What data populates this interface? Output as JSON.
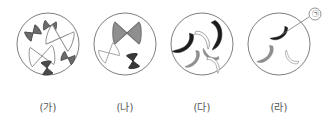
{
  "figure": {
    "background_color": "#ffffff",
    "width": 329,
    "height": 124,
    "cells": [
      {
        "id": "cell-ga",
        "label": "(가)",
        "center_x": 48,
        "center_y": 44,
        "radius": 31,
        "chromosome_count": 6,
        "chromosome_shape": "X-shaped",
        "chromosomes": [
          {
            "name": "dark-small-x-upper-left",
            "fill": "#6b6b6b",
            "stroke": "#4a4a4a",
            "cx": 33,
            "cy": 33,
            "len": 13,
            "rot": -35,
            "shade": "dark"
          },
          {
            "name": "dark-small-x-top",
            "fill": "#6b6b6b",
            "stroke": "#4a4a4a",
            "cx": 49,
            "cy": 26,
            "len": 11,
            "rot": 10,
            "shade": "dark"
          },
          {
            "name": "light-large-x-upper-right",
            "fill": "#ffffff",
            "stroke": "#8d8d8d",
            "cx": 59,
            "cy": 38,
            "len": 22,
            "rot": 20,
            "shade": "light"
          },
          {
            "name": "light-large-x-lower-left",
            "fill": "#ffffff",
            "stroke": "#8d8d8d",
            "cx": 42,
            "cy": 56,
            "len": 22,
            "rot": -8,
            "shade": "light"
          },
          {
            "name": "dark-small-x-right",
            "fill": "#6b6b6b",
            "stroke": "#4a4a4a",
            "cx": 68,
            "cy": 58,
            "len": 11,
            "rot": 25,
            "shade": "dark"
          },
          {
            "name": "dark-small-x-bottom",
            "fill": "#4a4a4a",
            "stroke": "#3a3a3a",
            "cx": 47,
            "cy": 68,
            "len": 12,
            "rot": 80,
            "shade": "dark"
          }
        ]
      },
      {
        "id": "cell-na",
        "label": "(나)",
        "center_x": 125,
        "center_y": 44,
        "radius": 31,
        "chromosome_count": 3,
        "chromosome_shape": "X-shaped",
        "chromosomes": [
          {
            "name": "gray-large-x-top",
            "fill": "#8f8f8f",
            "stroke": "#6f6f6f",
            "cx": 127,
            "cy": 33,
            "len": 24,
            "rot": 0,
            "shade": "gray"
          },
          {
            "name": "light-x-left",
            "fill": "#ffffff",
            "stroke": "#9a9a9a",
            "cx": 109,
            "cy": 53,
            "len": 16,
            "rot": -30,
            "shade": "light"
          },
          {
            "name": "dark-small-x-lower-right",
            "fill": "#3a3a3a",
            "stroke": "#2a2a2a",
            "cx": 133,
            "cy": 61,
            "len": 13,
            "rot": 80,
            "shade": "dark"
          }
        ]
      },
      {
        "id": "cell-da",
        "label": "(다)",
        "center_x": 202,
        "center_y": 44,
        "radius": 31,
        "chromosome_count": 6,
        "chromosome_shape": "rod-curved",
        "chromosomes": [
          {
            "name": "black-rod-left",
            "fill": "#1c1c1c",
            "cx": 183,
            "cy": 44,
            "shade": "black"
          },
          {
            "name": "black-rod-top-right",
            "fill": "#1c1c1c",
            "cx": 214,
            "cy": 33,
            "shade": "black"
          },
          {
            "name": "light-rod-middle",
            "fill": "#ffffff",
            "cx": 203,
            "cy": 40,
            "shade": "light"
          },
          {
            "name": "gray-rod-lower-left",
            "fill": "#8f8f8f",
            "cx": 192,
            "cy": 59,
            "shade": "gray"
          },
          {
            "name": "gray-rod-center-low",
            "fill": "#8f8f8f",
            "cx": 211,
            "cy": 54,
            "shade": "gray"
          },
          {
            "name": "light-rod-lower-right",
            "fill": "#ffffff",
            "cx": 214,
            "cy": 65,
            "shade": "light"
          }
        ]
      },
      {
        "id": "cell-ra",
        "label": "(라)",
        "center_x": 279,
        "center_y": 44,
        "radius": 31,
        "chromosome_count": 3,
        "chromosome_shape": "rod-curved",
        "chromosomes": [
          {
            "name": "black-rod-callout-target",
            "fill": "#1c1c1c",
            "cx": 279,
            "cy": 33,
            "shade": "black"
          },
          {
            "name": "gray-rod-left",
            "fill": "#8f8f8f",
            "cx": 265,
            "cy": 54,
            "shade": "gray"
          },
          {
            "name": "light-rod-right",
            "fill": "#ffffff",
            "cx": 292,
            "cy": 57,
            "shade": "light"
          }
        ]
      }
    ],
    "callout": {
      "symbol": "㉠",
      "marker_cx": 315,
      "marker_cy": 14,
      "marker_r": 6,
      "leader_from_x": 309,
      "leader_from_y": 17,
      "leader_to_x": 281,
      "leader_to_y": 35,
      "points_to": "cell-ra"
    },
    "colors": {
      "cell_outline": "#6f6f6f",
      "dark_chromosome": "#1c1c1c",
      "gray_chromosome": "#8f8f8f",
      "light_chromosome": "#ffffff",
      "light_chromosome_outline": "#9a9a9a",
      "label_text": "#555555",
      "callout_line": "#777777"
    }
  }
}
